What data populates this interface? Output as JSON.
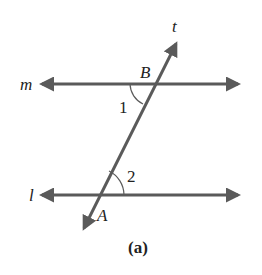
{
  "diagram": {
    "caption": "(a)",
    "lines": {
      "m": "m",
      "l": "l",
      "t": "t"
    },
    "points": {
      "A": "A",
      "B": "B"
    },
    "angles": {
      "angle1": "1",
      "angle2": "2"
    },
    "colors": {
      "line": "#5a5a5a",
      "text": "#222222"
    }
  }
}
